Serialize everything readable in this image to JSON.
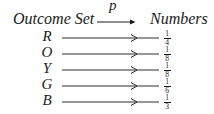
{
  "diagram": {
    "header": {
      "domain_label": "Outcome Set",
      "function_label": "p",
      "codomain_label": "Numbers"
    },
    "mappings": [
      {
        "outcome": "R",
        "numerator": "1",
        "denominator": "4"
      },
      {
        "outcome": "O",
        "numerator": "1",
        "denominator": "8"
      },
      {
        "outcome": "Y",
        "numerator": "1",
        "denominator": "8"
      },
      {
        "outcome": "G",
        "numerator": "1",
        "denominator": "6"
      },
      {
        "outcome": "B",
        "numerator": "1",
        "denominator": "3"
      }
    ],
    "colors": {
      "ink": "#1a1a1a",
      "background": "#ffffff"
    }
  }
}
